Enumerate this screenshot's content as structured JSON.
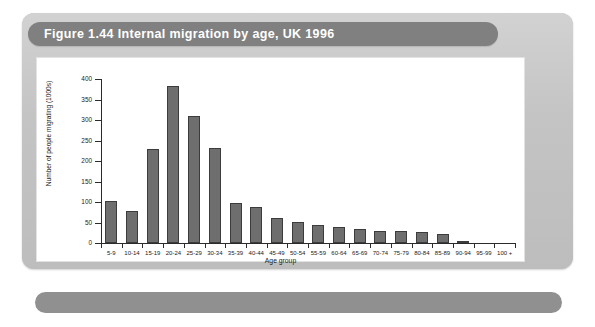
{
  "figure": {
    "title": "Figure 1.44 Internal migration by age, UK 1996",
    "panel_color": "#c9c9c9",
    "title_bar_color": "#808080",
    "bottom_bar_color": "#909090",
    "canvas_color": "#ffffff"
  },
  "chart_data": {
    "type": "bar",
    "title": "Figure 1.44 Internal migration by age, UK 1996",
    "xlabel": "Age group",
    "ylabel": "Number of people migrating (1000s)",
    "ylim": [
      0,
      400
    ],
    "ytick_labels": [
      "0",
      "50",
      "100",
      "150",
      "200",
      "250",
      "300",
      "350",
      "400"
    ],
    "yticks": [
      0,
      50,
      100,
      150,
      200,
      250,
      300,
      350,
      400
    ],
    "grid": false,
    "legend": null,
    "bar_color": "#6e6e6e",
    "bar_edge_color": "#3c3c3c",
    "categories": [
      "5-9",
      "10-14",
      "15-19",
      "20-24",
      "25-29",
      "30-34",
      "35-39",
      "40-44",
      "45-49",
      "50-54",
      "55-59",
      "60-64",
      "65-69",
      "70-74",
      "75-79",
      "80-84",
      "85-89",
      "90-94",
      "95-99",
      "100 +"
    ],
    "values": [
      103,
      78,
      230,
      383,
      310,
      232,
      97,
      88,
      60,
      52,
      45,
      38,
      33,
      30,
      29,
      28,
      22,
      6,
      0,
      0
    ]
  }
}
